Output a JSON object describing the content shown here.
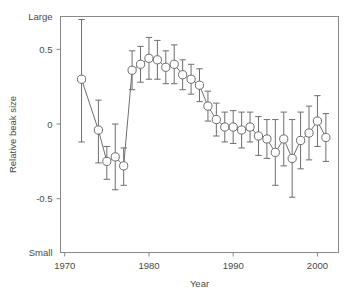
{
  "chart_data": {
    "type": "scatter",
    "title": "",
    "xlabel": "Year",
    "ylabel": "Relative beak size",
    "xlim": [
      1969.5,
      2002.5
    ],
    "ylim": [
      -0.86,
      0.72
    ],
    "grid": false,
    "legend": null,
    "x_ticks": [
      1970,
      1980,
      1990,
      2000
    ],
    "x_tick_labels": [
      "1970",
      "1980",
      "1990",
      "2000"
    ],
    "y_ticks": [
      0.72,
      0.5,
      0.0,
      -0.5,
      -0.86
    ],
    "y_tick_labels": [
      "Large",
      "0.5",
      "0",
      "-0.5",
      "Small"
    ],
    "marker": "open-circle",
    "marker_color": "#ffffff",
    "marker_edge_color": "#6e6e6e",
    "line_color": "#6e6e6e",
    "errorbar_color": "#6e6e6e",
    "errorbar_style": "vertical-capped",
    "series": [
      {
        "name": "Relative beak size",
        "x": [
          1972,
          1974,
          1975,
          1976,
          1977,
          1978,
          1979,
          1980,
          1981,
          1982,
          1983,
          1984,
          1985,
          1986,
          1987,
          1988,
          1989,
          1990,
          1991,
          1992,
          1993,
          1994,
          1995,
          1996,
          1997,
          1998,
          1999,
          2000,
          2001
        ],
        "y": [
          0.3,
          -0.04,
          -0.25,
          -0.22,
          -0.28,
          0.36,
          0.4,
          0.44,
          0.43,
          0.38,
          0.4,
          0.33,
          0.3,
          0.26,
          0.12,
          0.03,
          -0.02,
          -0.02,
          -0.04,
          -0.02,
          -0.08,
          -0.1,
          -0.19,
          -0.1,
          -0.23,
          -0.11,
          -0.06,
          0.02,
          -0.09
        ],
        "yerr_upper": [
          0.4,
          0.2,
          0.1,
          0.22,
          0.12,
          0.13,
          0.12,
          0.14,
          0.13,
          0.11,
          0.13,
          0.1,
          0.1,
          0.11,
          0.1,
          0.11,
          0.1,
          0.11,
          0.12,
          0.1,
          0.13,
          0.13,
          0.22,
          0.18,
          0.26,
          0.19,
          0.18,
          0.17,
          0.16
        ],
        "yerr_lower": [
          0.42,
          0.22,
          0.12,
          0.22,
          0.13,
          0.13,
          0.12,
          0.14,
          0.13,
          0.11,
          0.13,
          0.1,
          0.1,
          0.11,
          0.1,
          0.11,
          0.1,
          0.11,
          0.12,
          0.1,
          0.13,
          0.13,
          0.22,
          0.18,
          0.26,
          0.19,
          0.18,
          0.17,
          0.16
        ]
      }
    ]
  },
  "axes": {
    "x_axis_title": "Year",
    "y_axis_title": "Relative beak size"
  }
}
